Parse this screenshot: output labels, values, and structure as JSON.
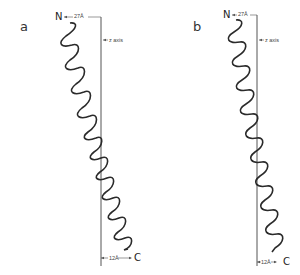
{
  "figure": {
    "panels": [
      {
        "label": "a",
        "n_terminus": "N",
        "c_terminus": "C",
        "top_distance": "27Å",
        "bottom_distance": "12Å",
        "axis_label": "z axis"
      },
      {
        "label": "b",
        "n_terminus": "N",
        "c_terminus": "C",
        "top_distance": "27Å",
        "bottom_distance": "12Å",
        "axis_label": "z axis"
      }
    ],
    "colors": {
      "line": "#333333",
      "background": "#ffffff"
    }
  }
}
